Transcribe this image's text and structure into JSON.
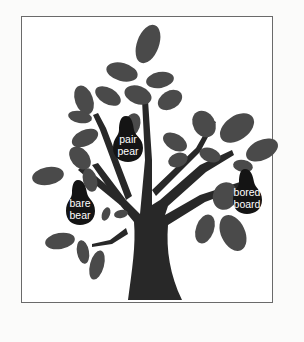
{
  "illustration": {
    "subject": "tree-with-homophone-pears",
    "colors": {
      "background": "#ffffff",
      "frame": "#6a6a6a",
      "trunk": "#282828",
      "leaf": "#4a4a4a",
      "pear": "#141414",
      "pear_text": "#ffffff"
    },
    "pears": [
      {
        "id": "pair-pear",
        "line1": "pair",
        "line2": "pear"
      },
      {
        "id": "bare-bear",
        "line1": "bare",
        "line2": "bear"
      },
      {
        "id": "bored-board",
        "line1": "bored",
        "line2": "board"
      }
    ]
  }
}
